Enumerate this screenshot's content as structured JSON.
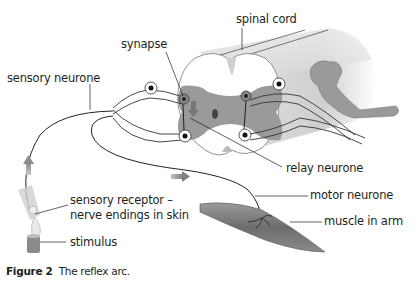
{
  "labels": {
    "spinal_cord": "spinal cord",
    "synapse": "synapse",
    "sensory_neurone": "sensory neurone",
    "relay_neurone": "relay neurone",
    "sensory_receptor_line1": "sensory receptor –",
    "sensory_receptor_line2": "nerve endings in skin",
    "motor_neurone": "motor neurone",
    "muscle_in_arm": "muscle in arm",
    "stimulus": "stimulus"
  },
  "caption": {
    "figure_number": "Figure 2",
    "text": "The reflex arc."
  },
  "colors": {
    "grey_matter": "#9a9a9a",
    "white_matter": "#ffffff",
    "cord_shading": "#d9d9d9",
    "arrow": "#8a8a8a",
    "muscle": "#7a7a7a",
    "text": "#231f20"
  }
}
